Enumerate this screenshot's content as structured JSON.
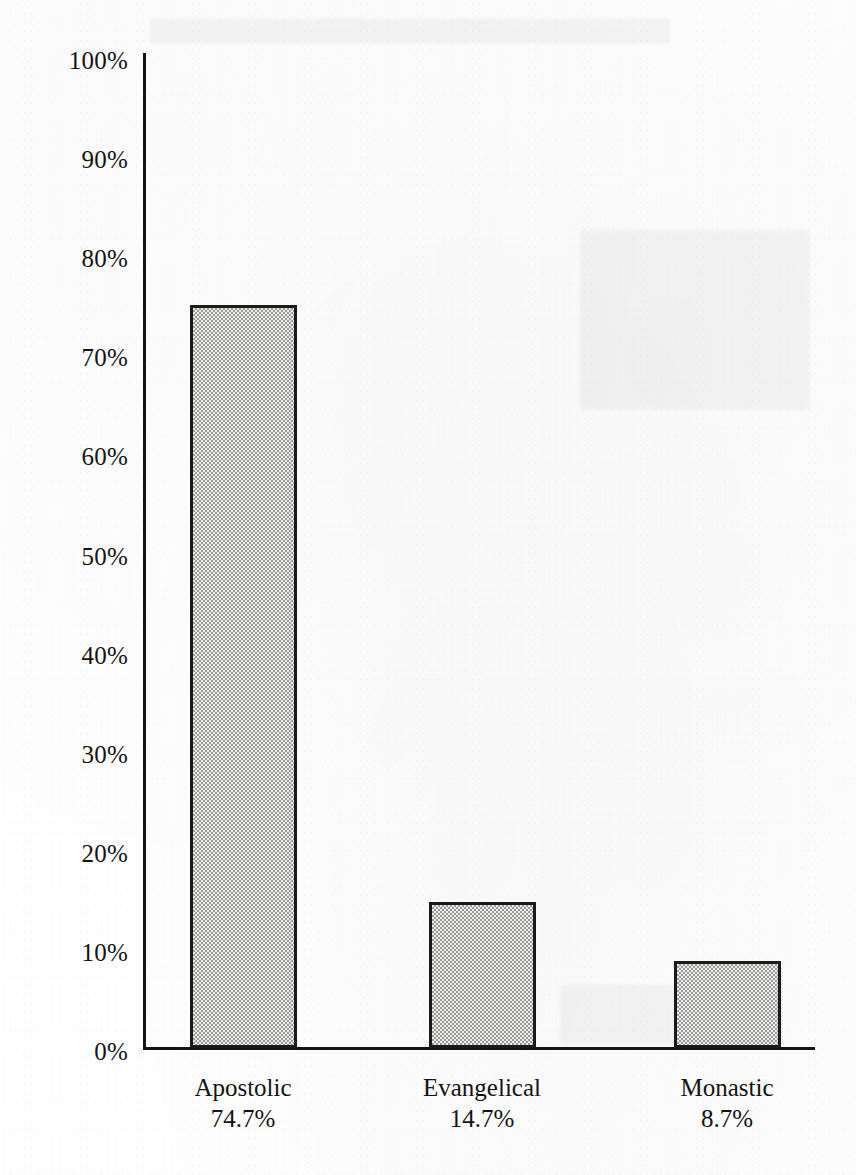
{
  "chart_data": {
    "type": "bar",
    "title": "",
    "subtitle": "",
    "xlabel": "",
    "ylabel": "",
    "categories": [
      "Apostolic",
      "Evangelical",
      "Monastic"
    ],
    "values": [
      74.7,
      14.7,
      8.7
    ],
    "value_labels": [
      "74.7%",
      "14.7%",
      "8.7%"
    ],
    "ylim": [
      0,
      100
    ],
    "y_tick_values": [
      0,
      10,
      20,
      30,
      40,
      50,
      60,
      70,
      80,
      90,
      100
    ],
    "y_tick_labels": [
      "0%",
      "10%",
      "20%",
      "30%",
      "40%",
      "50%",
      "60%",
      "70%",
      "80%",
      "90%",
      "100%"
    ],
    "grid": false,
    "legend": "none",
    "bar_fill": "dither-checkerboard-gray",
    "bar_border_color": "#1a1a1a",
    "axis_color": "#141414",
    "background_color": "#fefefe"
  },
  "axis": {
    "y_labels": {
      "t100": "100%",
      "t90": "90%",
      "t80": "80%",
      "t70": "70%",
      "t60": "60%",
      "t50": "50%",
      "t40": "40%",
      "t30": "30%",
      "t20": "20%",
      "t10": "10%",
      "t0": "0%"
    }
  },
  "bars": [
    {
      "name": "Apostolic",
      "value_label": "74.7%"
    },
    {
      "name": "Evangelical",
      "value_label": "14.7%"
    },
    {
      "name": "Monastic",
      "value_label": "8.7%"
    }
  ]
}
